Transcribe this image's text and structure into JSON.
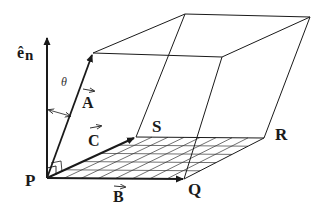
{
  "diagram": {
    "labels": {
      "normal": "ê",
      "normal_sub": "n",
      "theta": "θ",
      "vec_A": "A",
      "vec_B": "B",
      "vec_C": "C",
      "point_P": "P",
      "point_Q": "Q",
      "point_R": "R",
      "point_S": "S"
    },
    "vector_arrow_glyph": "→",
    "colors": {
      "ink": "#1a1a1a",
      "background": "#ffffff"
    },
    "base_grid": {
      "horizontal_divisions": 5,
      "diagonal_divisions": 8
    }
  }
}
